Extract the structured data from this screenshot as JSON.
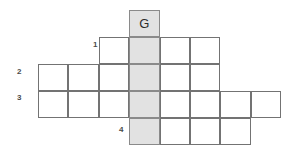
{
  "puzzle": {
    "type": "crossword-grid",
    "geometry": {
      "origin_x": 38,
      "origin_y": 10,
      "cell_width": 30.4,
      "cell_height": 27,
      "columns": 8,
      "rows": 5
    },
    "colors": {
      "grid_line": "#737373",
      "cell_fill": "#ffffff",
      "shaded_fill": "#e2e2e2",
      "shaded_line": "#8a8a8a",
      "letter": "#2b2b2b",
      "number": "#4a4a4a",
      "background": "#ffffff"
    },
    "rows": [
      {
        "index": 0,
        "label": "",
        "start_col": 4,
        "cell_count": 1,
        "cells": [
          {
            "col": 4,
            "letter": "G",
            "shaded": true
          }
        ]
      },
      {
        "index": 1,
        "label": "1",
        "start_col": 3,
        "cell_count": 4,
        "cells": [
          {
            "col": 3,
            "letter": "",
            "shaded": false
          },
          {
            "col": 4,
            "letter": "",
            "shaded": true
          },
          {
            "col": 5,
            "letter": "",
            "shaded": false
          },
          {
            "col": 6,
            "letter": "",
            "shaded": false
          }
        ]
      },
      {
        "index": 2,
        "label": "2",
        "start_col": 1,
        "cell_count": 6,
        "cells": [
          {
            "col": 1,
            "letter": "",
            "shaded": false
          },
          {
            "col": 2,
            "letter": "",
            "shaded": false
          },
          {
            "col": 3,
            "letter": "",
            "shaded": false
          },
          {
            "col": 4,
            "letter": "",
            "shaded": true
          },
          {
            "col": 5,
            "letter": "",
            "shaded": false
          },
          {
            "col": 6,
            "letter": "",
            "shaded": false
          }
        ]
      },
      {
        "index": 3,
        "label": "3",
        "start_col": 1,
        "cell_count": 8,
        "cells": [
          {
            "col": 1,
            "letter": "",
            "shaded": false
          },
          {
            "col": 2,
            "letter": "",
            "shaded": false
          },
          {
            "col": 3,
            "letter": "",
            "shaded": false
          },
          {
            "col": 4,
            "letter": "",
            "shaded": true
          },
          {
            "col": 5,
            "letter": "",
            "shaded": false
          },
          {
            "col": 6,
            "letter": "",
            "shaded": false
          },
          {
            "col": 7,
            "letter": "",
            "shaded": false
          },
          {
            "col": 8,
            "letter": "",
            "shaded": false
          }
        ]
      },
      {
        "index": 4,
        "label": "4",
        "start_col": 4,
        "cell_count": 4,
        "cells": [
          {
            "col": 4,
            "letter": "",
            "shaded": true
          },
          {
            "col": 5,
            "letter": "",
            "shaded": false
          },
          {
            "col": 6,
            "letter": "",
            "shaded": false
          },
          {
            "col": 7,
            "letter": "",
            "shaded": false
          }
        ]
      }
    ],
    "clue_numbers": [
      {
        "text": "1",
        "x": 93,
        "y": 41
      },
      {
        "text": "2",
        "x": 17,
        "y": 68
      },
      {
        "text": "3",
        "x": 17,
        "y": 94
      },
      {
        "text": "4",
        "x": 119,
        "y": 126
      }
    ]
  }
}
